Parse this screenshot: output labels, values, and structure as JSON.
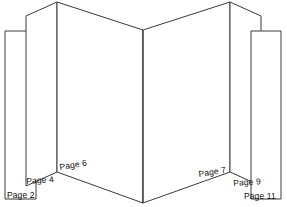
{
  "diagram": {
    "type": "folded-book-pages-illustration",
    "background_color": "#ffffff",
    "line_color": "#3a3a3a",
    "label_color": "#111111",
    "spine": {
      "top_apex_x": 143,
      "top_apex_y": 30,
      "bottom_apex_x": 143,
      "bottom_apex_y": 203
    },
    "labels": [
      {
        "id": "page-2",
        "text": "Page 2",
        "side": "left",
        "rotation_deg": 0
      },
      {
        "id": "page-4",
        "text": "Page 4",
        "side": "left",
        "rotation_deg": -4
      },
      {
        "id": "page-6",
        "text": "Page 6",
        "side": "left",
        "rotation_deg": -9
      },
      {
        "id": "page-7",
        "text": "Page 7",
        "side": "right",
        "rotation_deg": -9
      },
      {
        "id": "page-9",
        "text": "Page 9",
        "side": "right",
        "rotation_deg": -4
      },
      {
        "id": "page-11",
        "text": "Page 11",
        "side": "right",
        "rotation_deg": 0
      }
    ],
    "panels": [
      {
        "id": "left-outer",
        "label": "Page 2",
        "outline": "5,31 36,31 36,199 5,199"
      },
      {
        "id": "left-middle",
        "label": "Page 4",
        "outline": "26,16 57,2 57,172 26,186"
      },
      {
        "id": "left-inner",
        "label": "Page 6",
        "outline": "57,2 143,30 143,203 57,172"
      },
      {
        "id": "right-inner",
        "label": "Page 7",
        "outline": "143,30 230,2 230,172 143,203"
      },
      {
        "id": "right-middle",
        "label": "Page 9",
        "outline": "230,2 261,16 261,186 230,172"
      },
      {
        "id": "right-outer",
        "label": "Page 11",
        "outline": "251,31 281,31 281,199 251,199"
      }
    ]
  }
}
